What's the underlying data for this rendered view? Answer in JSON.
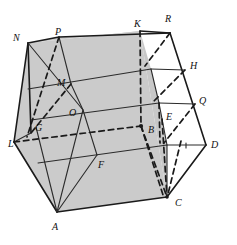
{
  "figure": {
    "kind": "geometry-diagram",
    "colors": {
      "background": "#ffffff",
      "shaded_face": "#cbcbcb",
      "shaded_face_dark": "#c3c3c3",
      "white_panel": "#ffffff",
      "stroke": "#1a1a1a",
      "thin_stroke": "#2b2b2b",
      "label": "#111111"
    },
    "labels": [
      {
        "id": "N",
        "text": "N",
        "x": 13,
        "y": 33
      },
      {
        "id": "P",
        "text": "P",
        "x": 55,
        "y": 27
      },
      {
        "id": "K",
        "text": "K",
        "x": 134,
        "y": 19
      },
      {
        "id": "R",
        "text": "R",
        "x": 165,
        "y": 14
      },
      {
        "id": "H",
        "text": "H",
        "x": 190,
        "y": 61
      },
      {
        "id": "M",
        "text": "M",
        "x": 57,
        "y": 78
      },
      {
        "id": "Q",
        "text": "Q",
        "x": 199,
        "y": 96
      },
      {
        "id": "O",
        "text": "O",
        "x": 69,
        "y": 108
      },
      {
        "id": "E",
        "text": "E",
        "x": 166,
        "y": 112
      },
      {
        "id": "G",
        "text": "G",
        "x": 35,
        "y": 123
      },
      {
        "id": "B",
        "text": "B",
        "x": 148,
        "y": 125
      },
      {
        "id": "L",
        "text": "L",
        "x": 8,
        "y": 139
      },
      {
        "id": "D",
        "text": "D",
        "x": 211,
        "y": 140
      },
      {
        "id": "F",
        "text": "F",
        "x": 98,
        "y": 160
      },
      {
        "id": "C",
        "text": "C",
        "x": 175,
        "y": 198
      },
      {
        "id": "A",
        "text": "A",
        "x": 52,
        "y": 222
      }
    ],
    "vertices": {
      "N": [
        28,
        43
      ],
      "P": [
        59,
        37
      ],
      "K": [
        140,
        31
      ],
      "R": [
        170,
        33
      ],
      "H": [
        185,
        70
      ],
      "M": [
        71,
        84
      ],
      "Q": [
        195,
        104
      ],
      "O": [
        83,
        110
      ],
      "E": [
        162,
        119
      ],
      "G": [
        36,
        127
      ],
      "B": [
        141,
        126
      ],
      "L": [
        14,
        142
      ],
      "D": [
        206,
        145
      ],
      "F": [
        97,
        155
      ],
      "C": [
        167,
        197
      ],
      "A": [
        57,
        212
      ]
    }
  }
}
